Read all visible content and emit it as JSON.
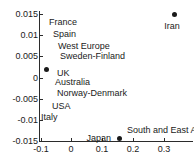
{
  "chart_data": {
    "type": "scatter",
    "title": "",
    "xlabel": "",
    "ylabel": "",
    "xlim": [
      -0.105,
      0.395
    ],
    "ylim": [
      -0.015,
      0.0155
    ],
    "xticks": [
      "-0.1",
      "0",
      "0.1",
      "0.2",
      "0.3"
    ],
    "xtick_values": [
      -0.1,
      0,
      0.1,
      0.2,
      0.3
    ],
    "yticks": [
      "0.015",
      "0.01",
      "0.005",
      "0",
      "-0.005",
      "-0.01",
      "-0.015"
    ],
    "ytick_values": [
      0.015,
      0.01,
      0.005,
      0,
      -0.005,
      -0.01,
      -0.015
    ],
    "grid": false,
    "legend": "none",
    "points": [
      {
        "label": "Iran",
        "x": 0.335,
        "y": 0.015,
        "label_dx": -3,
        "label_dy": 12,
        "label_anchor": "middle"
      },
      {
        "label": "UK",
        "x": -0.08,
        "y": 0.0018,
        "label_dx": 10,
        "label_dy": 3,
        "label_anchor": "start"
      },
      {
        "label": "South and East Asia",
        "x": 0.155,
        "y": -0.0145,
        "label_dx": 8,
        "label_dy": -9,
        "label_anchor": "start"
      },
      {
        "label": "Japan",
        "x": 0.155,
        "y": -0.0145,
        "label_dx": -8,
        "label_dy": -1,
        "label_anchor": "end"
      }
    ],
    "annotations": [
      {
        "text": "France",
        "x": -0.072,
        "y": 0.0132
      },
      {
        "text": "Spain",
        "x": -0.058,
        "y": 0.0103
      },
      {
        "text": "West Europe",
        "x": -0.043,
        "y": 0.0074
      },
      {
        "text": "Sweden-Finland",
        "x": -0.038,
        "y": 0.0051
      },
      {
        "text": "Australia",
        "x": -0.052,
        "y": -0.001
      },
      {
        "text": "Norway-Denmark",
        "x": -0.048,
        "y": -0.0036
      },
      {
        "text": "USA",
        "x": -0.062,
        "y": -0.0068
      },
      {
        "text": "Italy",
        "x": -0.098,
        "y": -0.0093
      }
    ]
  }
}
